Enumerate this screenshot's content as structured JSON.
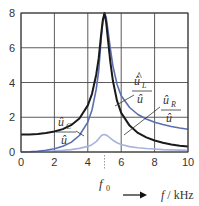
{
  "chart_data": {
    "type": "line",
    "title": "",
    "xlabel": "f / kHz",
    "ylabel": "",
    "xlim": [
      0,
      10
    ],
    "ylim": [
      0,
      8
    ],
    "grid": true,
    "x_ticks": [
      "0",
      "2",
      "4",
      "6",
      "8",
      "10"
    ],
    "y_ticks": [
      "0",
      "2",
      "4",
      "6",
      "8"
    ],
    "annotations": {
      "f0_label": "f",
      "f0_sub": "0",
      "f0_value": 5,
      "xlabel_var": "f",
      "xlabel_unit": " / kHz"
    },
    "x": [
      0,
      0.5,
      1,
      1.5,
      2,
      2.5,
      3,
      3.5,
      4,
      4.25,
      4.5,
      4.65,
      4.8,
      4.9,
      5,
      5.1,
      5.2,
      5.35,
      5.5,
      5.75,
      6,
      6.5,
      7,
      7.5,
      8,
      8.5,
      9,
      9.5,
      10
    ],
    "series": [
      {
        "name": "û_C / û",
        "label_num": "û",
        "label_num_sub": "C",
        "label_den": "û",
        "color": "#1a1a1a",
        "values": [
          1.0,
          1.01,
          1.04,
          1.09,
          1.18,
          1.32,
          1.54,
          1.93,
          2.68,
          3.35,
          4.45,
          5.4,
          6.8,
          7.6,
          8.0,
          7.45,
          6.55,
          5.2,
          4.1,
          2.95,
          2.25,
          1.52,
          1.1,
          0.84,
          0.66,
          0.53,
          0.44,
          0.36,
          0.31
        ]
      },
      {
        "name": "û_L / û",
        "label_num": "û",
        "label_num_sub": "L",
        "label_den": "û",
        "color": "#5b6fb0",
        "values": [
          0.0,
          0.01,
          0.04,
          0.1,
          0.19,
          0.33,
          0.55,
          0.95,
          1.72,
          2.42,
          3.6,
          4.67,
          6.53,
          7.47,
          8.0,
          7.75,
          7.08,
          5.96,
          4.96,
          3.9,
          3.24,
          2.56,
          2.16,
          1.9,
          1.71,
          1.58,
          1.47,
          1.38,
          1.31
        ]
      },
      {
        "name": "û_R / û",
        "label_num": "û",
        "label_num_sub": "R",
        "label_den": "û",
        "color": "#a9b4dc",
        "values": [
          0.0,
          0.01,
          0.03,
          0.05,
          0.07,
          0.1,
          0.14,
          0.21,
          0.32,
          0.42,
          0.6,
          0.76,
          0.94,
          0.99,
          1.0,
          0.98,
          0.92,
          0.8,
          0.68,
          0.53,
          0.43,
          0.31,
          0.24,
          0.2,
          0.17,
          0.14,
          0.12,
          0.11,
          0.1
        ]
      }
    ],
    "legend_position": "inline"
  }
}
